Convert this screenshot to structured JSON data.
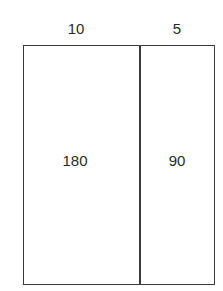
{
  "diagram": {
    "type": "area-model-rectangle",
    "top_labels": {
      "left_width": "10",
      "right_width": "5"
    },
    "regions": [
      {
        "name": "left",
        "area": "180"
      },
      {
        "name": "right",
        "area": "90"
      }
    ],
    "colors": {
      "line": "#3a3a3a",
      "text": "#2a2a2a",
      "background": "#ffffff"
    }
  }
}
